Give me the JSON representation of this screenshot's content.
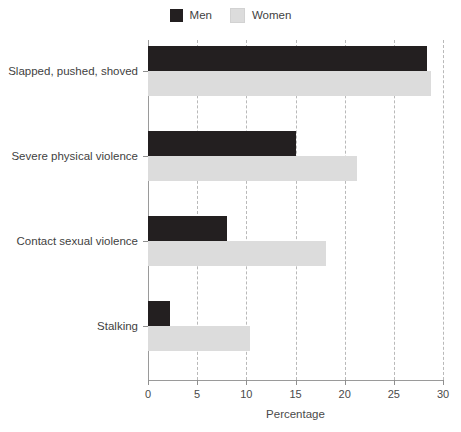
{
  "chart_data": {
    "type": "bar",
    "orientation": "horizontal",
    "title": "",
    "xlabel": "Percentage",
    "ylabel": "",
    "xlim": [
      0,
      30
    ],
    "xticks": [
      0,
      5,
      10,
      15,
      20,
      25,
      30
    ],
    "grid": "vertical-dashed",
    "legend_position": "top-center",
    "categories": [
      "Slapped, pushed, shoved",
      "Severe physical violence",
      "Contact sexual violence",
      "Stalking"
    ],
    "series": [
      {
        "name": "Men",
        "color": "#231f20",
        "values": [
          28.4,
          15.0,
          8.0,
          2.2
        ]
      },
      {
        "name": "Women",
        "color": "#dcdcdc",
        "values": [
          28.8,
          21.3,
          18.1,
          10.4
        ]
      }
    ]
  },
  "legend": {
    "items": [
      {
        "label": "Men",
        "color": "#231f20"
      },
      {
        "label": "Women",
        "color": "#dcdcdc"
      }
    ]
  },
  "axis": {
    "x_title": "Percentage",
    "x_tick_labels": [
      "0",
      "5",
      "10",
      "15",
      "20",
      "25",
      "30"
    ]
  }
}
